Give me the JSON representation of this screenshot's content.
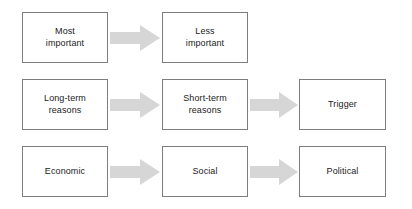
{
  "diagram": {
    "colors": {
      "background": "#ffffff",
      "box_border": "#7d7d7d",
      "box_fill": "#ffffff",
      "arrow_fill": "#d6d6d6",
      "text": "#1b1b1b"
    },
    "rows": [
      {
        "id": "row-1",
        "nodes": [
          {
            "id": "most-important",
            "label": "Most\nimportant",
            "column": 1
          },
          {
            "id": "less-important",
            "label": "Less\nimportant",
            "column": 2
          }
        ],
        "arrows": [
          {
            "id": "arrow-1-1",
            "from": "most-important",
            "to": "less-important",
            "direction": "right"
          }
        ]
      },
      {
        "id": "row-2",
        "nodes": [
          {
            "id": "long-term-reasons",
            "label": "Long-term\nreasons",
            "column": 1
          },
          {
            "id": "short-term-reasons",
            "label": "Short-term\nreasons",
            "column": 2
          },
          {
            "id": "trigger",
            "label": "Trigger",
            "column": 3
          }
        ],
        "arrows": [
          {
            "id": "arrow-2-1",
            "from": "long-term-reasons",
            "to": "short-term-reasons",
            "direction": "right"
          },
          {
            "id": "arrow-2-2",
            "from": "short-term-reasons",
            "to": "trigger",
            "direction": "right"
          }
        ]
      },
      {
        "id": "row-3",
        "nodes": [
          {
            "id": "economic",
            "label": "Economic",
            "column": 1
          },
          {
            "id": "social",
            "label": "Social",
            "column": 2
          },
          {
            "id": "political",
            "label": "Political",
            "column": 3
          }
        ],
        "arrows": [
          {
            "id": "arrow-3-1",
            "from": "economic",
            "to": "social",
            "direction": "right"
          },
          {
            "id": "arrow-3-2",
            "from": "social",
            "to": "political",
            "direction": "right"
          }
        ]
      }
    ]
  }
}
